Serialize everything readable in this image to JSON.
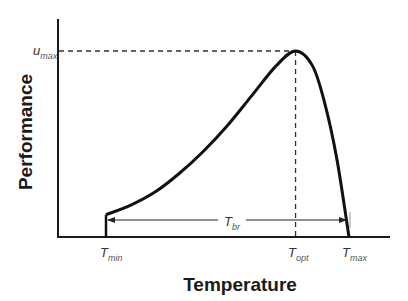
{
  "chart_data": {
    "type": "line",
    "title": "",
    "xlabel": "Temperature",
    "ylabel": "Performance",
    "x_ticks": [
      {
        "id": "tmin",
        "main": "T",
        "sub": "min",
        "x": 0.0
      },
      {
        "id": "topt",
        "main": "T",
        "sub": "opt",
        "x": 0.78
      },
      {
        "id": "tmax",
        "main": "T",
        "sub": "max",
        "x": 1.0
      }
    ],
    "y_ticks": [
      {
        "id": "umax",
        "main": "u",
        "sub": "max",
        "y": 1.0
      }
    ],
    "curve": {
      "name": "Thermal performance curve",
      "description": "Performance rises from a nonzero value at Tmin, accelerating then decelerating to a peak umax at Topt, then drops steeply to zero at Tmax",
      "x": [
        0.0,
        0.1,
        0.2,
        0.3,
        0.4,
        0.5,
        0.6,
        0.7,
        0.78,
        0.85,
        0.9,
        0.95,
        1.0
      ],
      "y": [
        0.12,
        0.17,
        0.24,
        0.34,
        0.46,
        0.6,
        0.76,
        0.92,
        1.0,
        0.92,
        0.72,
        0.42,
        0.0
      ]
    },
    "annotations": [
      {
        "type": "dashed-line",
        "label": "umax reference",
        "from": "y-axis",
        "to": "peak"
      },
      {
        "type": "dashed-line",
        "label": "Topt reference",
        "from": "peak",
        "to": "x-axis"
      },
      {
        "type": "double-arrow",
        "label_main": "T",
        "label_sub": "br",
        "meaning": "thermal breadth from Tmin to Tmax"
      }
    ],
    "grid": false,
    "legend": "none"
  }
}
